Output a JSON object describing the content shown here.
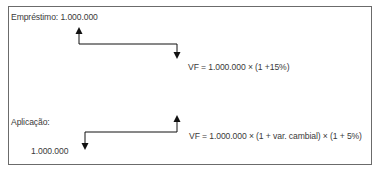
{
  "loan": {
    "label": "Empréstimo: 1.000.000",
    "formula": "VF = 1.000.000 × (1 +15%)"
  },
  "investment": {
    "label": "Aplicação:",
    "amount": "1.000.000",
    "formula": "VF = 1.000.000 × (1 + var. cambial) × (1 + 5%)"
  },
  "colors": {
    "border": "#6b6b6b",
    "text": "#3a3a3a",
    "arrow": "#111111"
  }
}
